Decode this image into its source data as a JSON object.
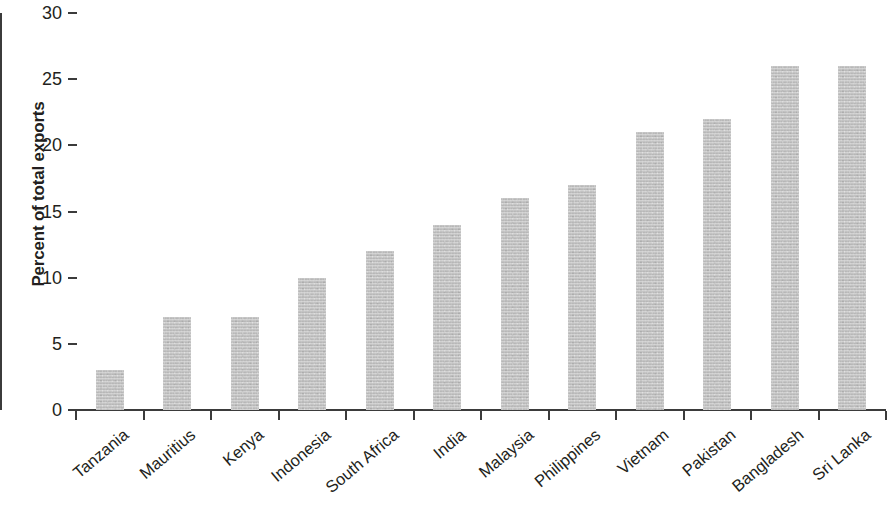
{
  "chart_data": {
    "type": "bar",
    "title": "",
    "subtitle": "",
    "xlabel": "",
    "ylabel": "Percent of total exports",
    "ylim": [
      0,
      30
    ],
    "yticks": [
      0,
      5,
      10,
      15,
      20,
      25,
      30
    ],
    "ytick_labels": [
      "0",
      "5",
      "10",
      "15",
      "20",
      "25",
      "30"
    ],
    "grid": false,
    "legend": null,
    "bar_color": "#bcbcbc",
    "axis_color": "#3b3b3b",
    "text_color": "#231f20",
    "categories": [
      "Tanzania",
      "Mauritius",
      "Kenya",
      "Indonesia",
      "South Africa",
      "India",
      "Malaysia",
      "Philippines",
      "Vietnam",
      "Pakistan",
      "Bangladesh",
      "Sri Lanka"
    ],
    "values": [
      3,
      7,
      7,
      10,
      12,
      14,
      16,
      17,
      21,
      22,
      26,
      26
    ],
    "series": [
      {
        "name": "Percent of total exports",
        "values": [
          3,
          7,
          7,
          10,
          12,
          14,
          16,
          17,
          21,
          22,
          26,
          26
        ]
      }
    ]
  }
}
